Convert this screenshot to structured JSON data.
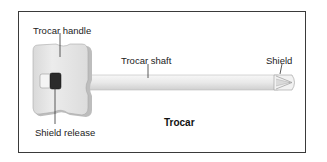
{
  "diagram": {
    "title": "Trocar",
    "labels": {
      "handle": "Trocar handle",
      "shaft": "Trocar shaft",
      "shield": "Shield",
      "shield_release": "Shield release"
    },
    "colors": {
      "frame": "#3a3a3a",
      "handle_fill": "#e4e4e4",
      "handle_shadow": "#b5b5b5",
      "shaft_fill": "#ececec",
      "release_button": "#2b2b2b",
      "leader_line": "#333333"
    }
  }
}
